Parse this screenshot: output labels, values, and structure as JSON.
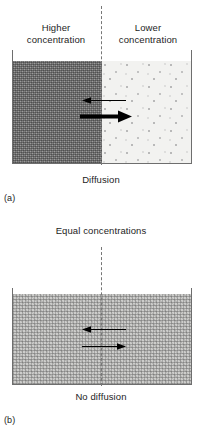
{
  "figure": {
    "panels": [
      {
        "tag": "(a)",
        "caption": "Diffusion",
        "headers": {
          "left": "Higher\nconcentration",
          "left_line1": "Higher",
          "left_line2": "concentration",
          "right": "Lower\nconcentration",
          "right_line1": "Lower",
          "right_line2": "concentration"
        },
        "vessel": {
          "left_half_fill": "dense-stipple",
          "right_half_fill": "sparse-dots",
          "divider_style": "dashed",
          "divider_color": "#777777",
          "wall_color": "#6e6e6e"
        },
        "arrows": [
          {
            "name": "thin-left-arrow",
            "direction": "left",
            "weight": "thin",
            "length_px": 42,
            "meaning": "small reverse flux"
          },
          {
            "name": "thick-right-arrow",
            "direction": "right",
            "weight": "thick",
            "length_px": 50,
            "meaning": "large net flux"
          }
        ]
      },
      {
        "tag": "(b)",
        "caption": "No diffusion",
        "headers": {
          "center": "Equal concentrations"
        },
        "vessel": {
          "left_half_fill": "medium-stipple",
          "right_half_fill": "medium-stipple",
          "divider_style": "dashed",
          "divider_color": "#777777",
          "wall_color": "#6e6e6e"
        },
        "arrows": [
          {
            "name": "thin-left-arrow",
            "direction": "left",
            "weight": "thin",
            "length_px": 42,
            "meaning": "equal reverse flux"
          },
          {
            "name": "thin-right-arrow",
            "direction": "right",
            "weight": "thin",
            "length_px": 42,
            "meaning": "equal forward flux"
          }
        ]
      }
    ]
  },
  "colors": {
    "ink": "#1d1d1d",
    "wall": "#6e6e6e",
    "divider": "#777777",
    "dense_fill": "#9c9c9c",
    "sparse_fill": "#f2f2f0",
    "medium_fill": "#cdcdcb",
    "arrow": "#000000",
    "background": "#ffffff"
  }
}
